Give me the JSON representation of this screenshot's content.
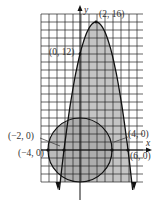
{
  "figure": {
    "type": "graph-of-system",
    "axes": {
      "x_label": "x",
      "y_label": "y",
      "x_range": [
        -5,
        8
      ],
      "y_range": [
        -4,
        16
      ],
      "grid_step": 1,
      "grid": true
    },
    "curves": [
      {
        "name": "parabola",
        "equation": "y = -(x-2)^2 + 16",
        "shaded": true,
        "fill": "#c4c4c4"
      },
      {
        "name": "circle",
        "equation": "x^2 + y^2 = 16",
        "shaded": true,
        "fill": "#a8a8a8"
      }
    ],
    "labels": {
      "vertex": "(2, 16)",
      "y_intercept": "(0, 12)",
      "parabola_left_root": "(−2, 0)",
      "circle_left": "(−4, 0)",
      "circle_right": "(4, 0)",
      "parabola_right_root": "(6, 0)"
    }
  }
}
